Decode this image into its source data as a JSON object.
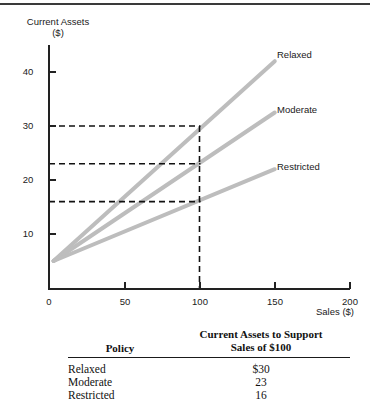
{
  "chart_data": {
    "type": "line",
    "title": "",
    "xlabel": "Sales ($)",
    "ylabel_line1": "Current Assets",
    "ylabel_line2": "($)",
    "xlim": [
      0,
      200
    ],
    "ylim": [
      0,
      46
    ],
    "xticks": [
      0,
      50,
      100,
      150,
      200
    ],
    "xticklabels": [
      "0",
      "50",
      "100",
      "150",
      "200"
    ],
    "yticks": [
      10,
      20,
      30,
      40
    ],
    "yticklabels": [
      "10",
      "20",
      "30",
      "40"
    ],
    "grid": false,
    "legend_position": "right-of-line-ends",
    "intercept": 5,
    "series": [
      {
        "name": "Relaxed",
        "label": "Relaxed",
        "color": "#bdbdbd",
        "x": [
          3,
          150
        ],
        "y": [
          5,
          42
        ],
        "value_at_100": 30
      },
      {
        "name": "Moderate",
        "label": "Moderate",
        "color": "#bdbdbd",
        "x": [
          3,
          150
        ],
        "y": [
          5,
          32.5
        ],
        "value_at_100": 23
      },
      {
        "name": "Restricted",
        "label": "Restricted",
        "color": "#bdbdbd",
        "x": [
          3,
          150
        ],
        "y": [
          5,
          22
        ],
        "value_at_100": 16
      }
    ],
    "annotations": {
      "guide_x": 100,
      "guide_y_values": [
        30,
        23,
        16
      ],
      "guide_style": "dashed"
    }
  },
  "table": {
    "header_policy": "Policy",
    "header_value_line1": "Current Assets to Support",
    "header_value_line2": "Sales of $100",
    "rows": [
      {
        "policy": "Relaxed",
        "value": "$30"
      },
      {
        "policy": "Moderate",
        "value": "23"
      },
      {
        "policy": "Restricted",
        "value": "16"
      }
    ]
  }
}
